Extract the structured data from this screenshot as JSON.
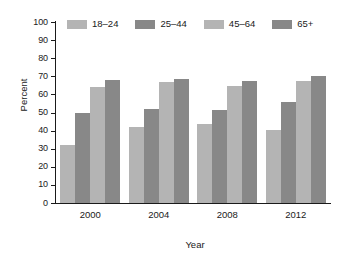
{
  "chart_data": {
    "type": "bar",
    "title": "",
    "subtitle": "",
    "xlabel": "Year",
    "ylabel": "Percent",
    "categories": [
      "2000",
      "2004",
      "2008",
      "2012"
    ],
    "series": [
      {
        "name": "18–24",
        "color": "#b4b4b4",
        "values": [
          32,
          42,
          43.5,
          40.5
        ]
      },
      {
        "name": "25–44",
        "color": "#888888",
        "values": [
          50,
          52,
          51.5,
          56
        ]
      },
      {
        "name": "45–64",
        "color": "#b4b4b4",
        "values": [
          64,
          67,
          64.5,
          67.5
        ]
      },
      {
        "name": "65+",
        "color": "#888888",
        "values": [
          68,
          68.5,
          67.5,
          70
        ]
      }
    ],
    "ylim": [
      0,
      100
    ],
    "yticks": [
      0,
      10,
      20,
      30,
      40,
      50,
      60,
      70,
      80,
      90,
      100
    ],
    "ytick_labels": [
      "0",
      "10",
      "20",
      "30",
      "40",
      "50",
      "60",
      "70",
      "80",
      "90",
      "100"
    ],
    "grid": false,
    "legend_position": "top-inside",
    "legend_entries": [
      "18–24",
      "25–44",
      "45–64",
      "65+"
    ],
    "background_color": "#ffffff",
    "axis_color": "#1a1a1a"
  }
}
